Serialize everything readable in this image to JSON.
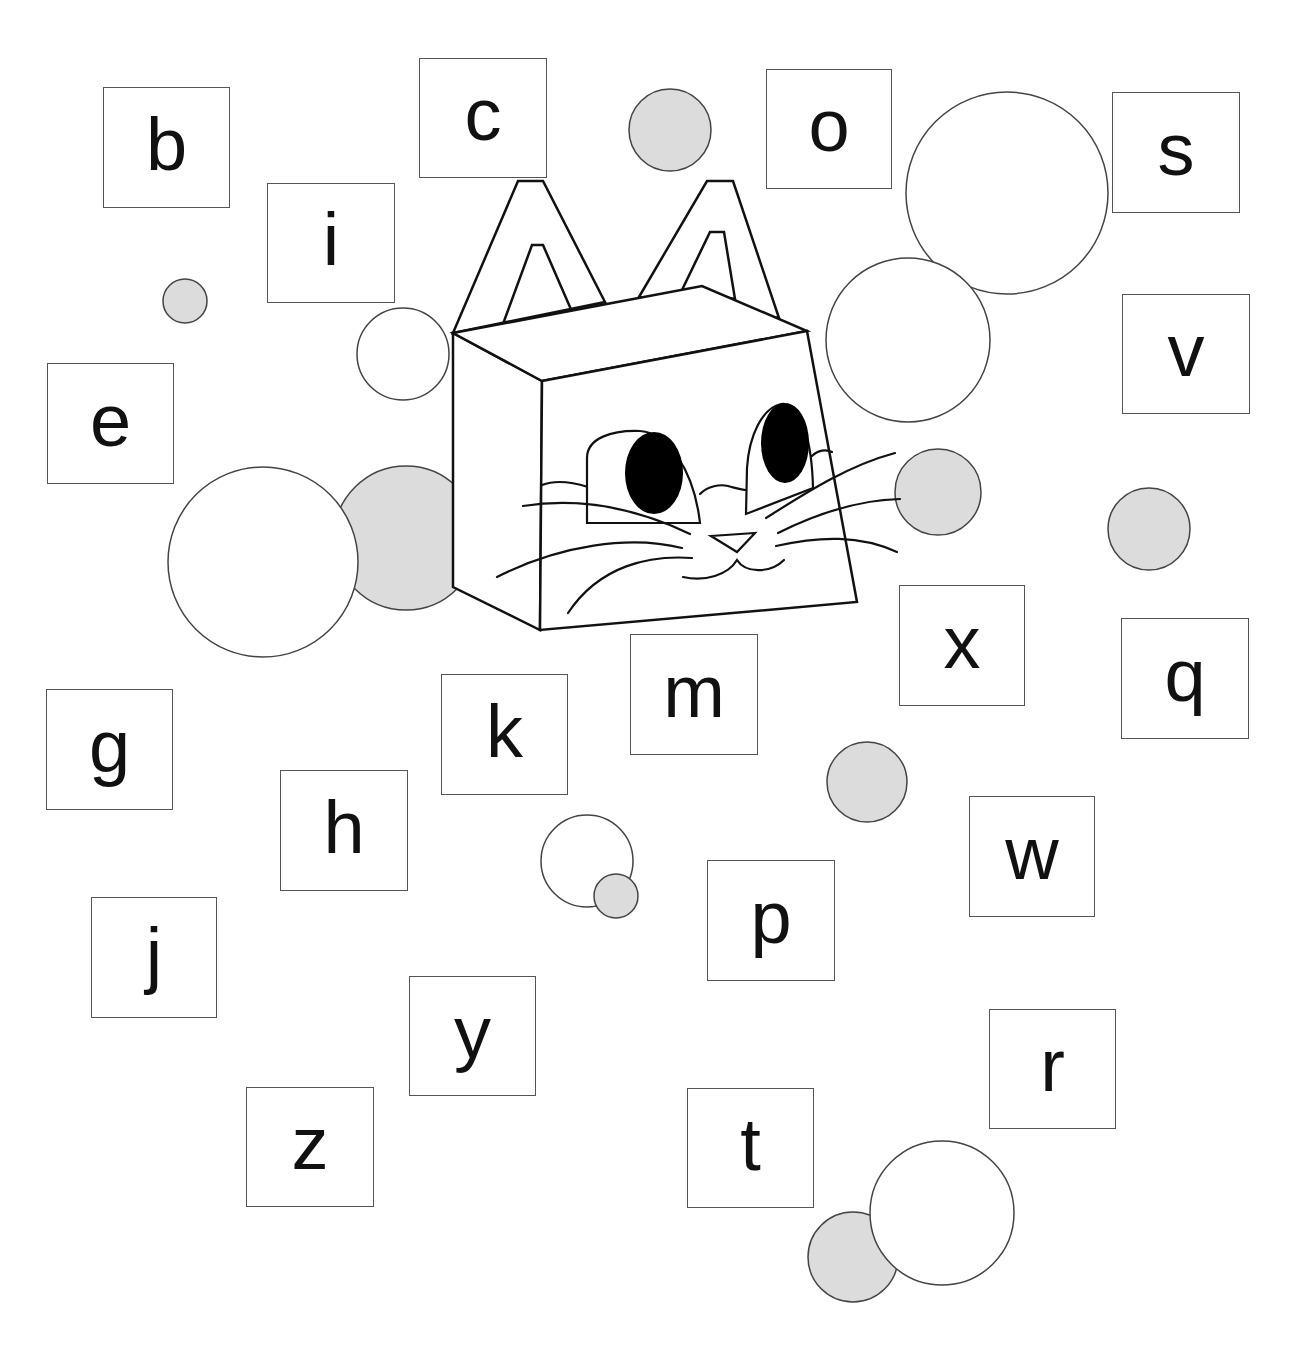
{
  "colors": {
    "background": "#ffffff",
    "box_border": "#555555",
    "circle_stroke": "#444444",
    "circle_grey_fill": "#dcdcdc",
    "circle_white_fill": "#ffffff",
    "ink": "#111111"
  },
  "letter_boxes": [
    {
      "letter": "b",
      "x": 103,
      "y": 87,
      "w": 127,
      "h": 121
    },
    {
      "letter": "c",
      "x": 419,
      "y": 58,
      "w": 128,
      "h": 120
    },
    {
      "letter": "o",
      "x": 766,
      "y": 69,
      "w": 126,
      "h": 120
    },
    {
      "letter": "s",
      "x": 1112,
      "y": 92,
      "w": 128,
      "h": 121
    },
    {
      "letter": "i",
      "x": 267,
      "y": 183,
      "w": 128,
      "h": 120
    },
    {
      "letter": "v",
      "x": 1122,
      "y": 294,
      "w": 128,
      "h": 120
    },
    {
      "letter": "e",
      "x": 47,
      "y": 363,
      "w": 127,
      "h": 121
    },
    {
      "letter": "x",
      "x": 899,
      "y": 585,
      "w": 126,
      "h": 121
    },
    {
      "letter": "q",
      "x": 1121,
      "y": 618,
      "w": 128,
      "h": 121
    },
    {
      "letter": "m",
      "x": 630,
      "y": 634,
      "w": 128,
      "h": 121
    },
    {
      "letter": "g",
      "x": 46,
      "y": 689,
      "w": 127,
      "h": 121
    },
    {
      "letter": "k",
      "x": 441,
      "y": 674,
      "w": 127,
      "h": 121
    },
    {
      "letter": "h",
      "x": 280,
      "y": 770,
      "w": 128,
      "h": 121
    },
    {
      "letter": "w",
      "x": 969,
      "y": 796,
      "w": 126,
      "h": 121
    },
    {
      "letter": "p",
      "x": 707,
      "y": 860,
      "w": 128,
      "h": 121
    },
    {
      "letter": "j",
      "x": 91,
      "y": 897,
      "w": 126,
      "h": 121
    },
    {
      "letter": "y",
      "x": 409,
      "y": 976,
      "w": 127,
      "h": 120
    },
    {
      "letter": "r",
      "x": 989,
      "y": 1009,
      "w": 127,
      "h": 120
    },
    {
      "letter": "z",
      "x": 246,
      "y": 1087,
      "w": 128,
      "h": 120
    },
    {
      "letter": "t",
      "x": 687,
      "y": 1088,
      "w": 127,
      "h": 120
    }
  ],
  "circles_behind": [
    {
      "cx": 406,
      "cy": 538,
      "r": 72,
      "fill": "grey"
    }
  ],
  "circles": [
    {
      "cx": 670,
      "cy": 130,
      "r": 41,
      "fill": "grey"
    },
    {
      "cx": 1007,
      "cy": 193,
      "r": 101,
      "fill": "white"
    },
    {
      "cx": 908,
      "cy": 340,
      "r": 82,
      "fill": "white"
    },
    {
      "cx": 185,
      "cy": 301,
      "r": 22,
      "fill": "grey"
    },
    {
      "cx": 403,
      "cy": 354,
      "r": 46,
      "fill": "white"
    },
    {
      "cx": 938,
      "cy": 492,
      "r": 43,
      "fill": "grey"
    },
    {
      "cx": 1149,
      "cy": 529,
      "r": 41,
      "fill": "grey"
    },
    {
      "cx": 263,
      "cy": 562,
      "r": 95,
      "fill": "white"
    },
    {
      "cx": 867,
      "cy": 782,
      "r": 40,
      "fill": "grey"
    },
    {
      "cx": 587,
      "cy": 861,
      "r": 46,
      "fill": "white"
    },
    {
      "cx": 616,
      "cy": 896,
      "r": 22,
      "fill": "grey"
    },
    {
      "cx": 853,
      "cy": 1257,
      "r": 45,
      "fill": "grey"
    },
    {
      "cx": 942,
      "cy": 1213,
      "r": 72,
      "fill": "white"
    }
  ],
  "cat": {
    "label": "cube cat head"
  }
}
